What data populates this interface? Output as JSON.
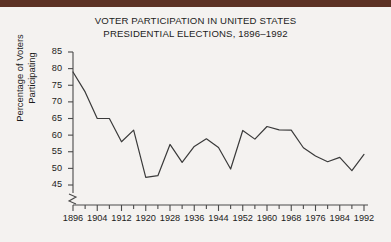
{
  "figure": {
    "title_lines": [
      "VOTER PARTICIPATION IN UNITED STATES",
      "PRESIDENTIAL ELECTIONS, 1896–1992"
    ],
    "ylabel_lines": [
      "Percentage of Voters",
      "Participating"
    ],
    "line_color": "#3a3a3a",
    "axis_color": "#4a4a4a",
    "background_color": "#f4f2f0",
    "scan_bar_color": "#5c3224"
  },
  "chart_data": {
    "type": "line",
    "title": "VOTER PARTICIPATION IN UNITED STATES PRESIDENTIAL ELECTIONS, 1896–1992",
    "xlabel": "",
    "ylabel": "Percentage of Voters Participating",
    "xlim": [
      1896,
      1992
    ],
    "ylim": [
      44,
      85
    ],
    "yticks": [
      45,
      50,
      55,
      60,
      65,
      70,
      75,
      80,
      85
    ],
    "ytick_labels": [
      "45",
      "50",
      "55",
      "60",
      "65",
      "70",
      "75",
      "80",
      "85"
    ],
    "xticks_major": [
      1896,
      1904,
      1912,
      1920,
      1928,
      1936,
      1944,
      1952,
      1960,
      1968,
      1976,
      1984,
      1992
    ],
    "xtick_labels": [
      "1896",
      "1904",
      "1912",
      "1920",
      "1928",
      "1936",
      "1944",
      "1952",
      "1960",
      "1968",
      "1976",
      "1984",
      "1992"
    ],
    "xtick_minor_step": 4,
    "grid": false,
    "legend": false,
    "y_axis_break": true,
    "x": [
      1896,
      1900,
      1904,
      1908,
      1912,
      1916,
      1920,
      1924,
      1928,
      1932,
      1936,
      1940,
      1944,
      1948,
      1952,
      1956,
      1960,
      1964,
      1968,
      1972,
      1976,
      1980,
      1984,
      1988,
      1992
    ],
    "values": [
      79.0,
      73.0,
      65.0,
      65.0,
      58.0,
      61.5,
      47.3,
      47.8,
      57.2,
      51.8,
      56.6,
      58.9,
      56.3,
      49.8,
      61.4,
      58.8,
      62.6,
      61.6,
      61.5,
      56.2,
      53.7,
      52.0,
      53.3,
      49.3,
      54.2
    ]
  }
}
